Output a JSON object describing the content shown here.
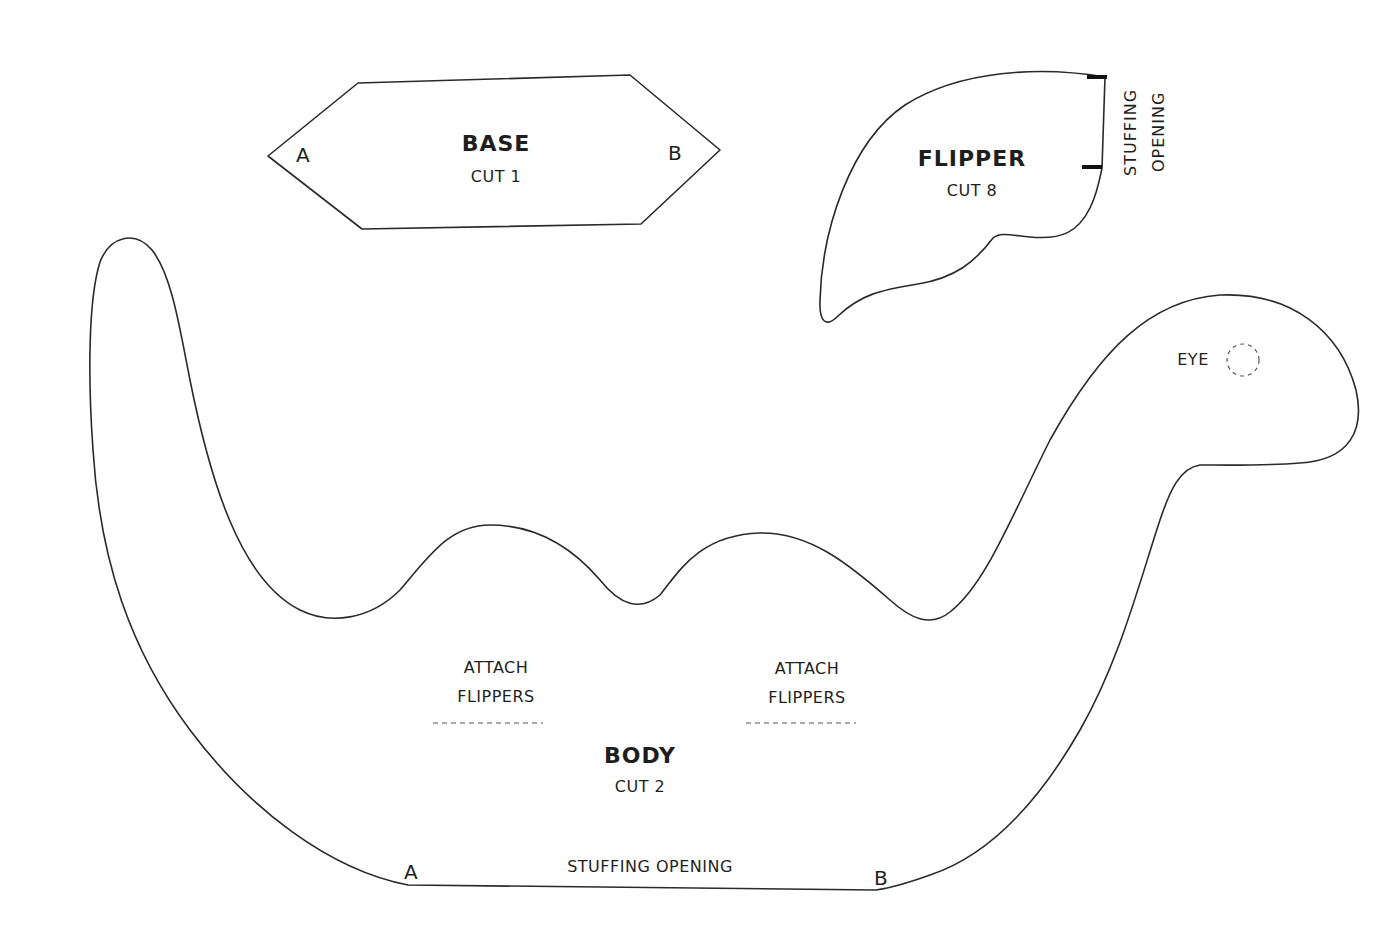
{
  "pattern": {
    "pieces": {
      "base": {
        "title": "BASE",
        "cut": "CUT 1",
        "point_a": "A",
        "point_b": "B"
      },
      "flipper": {
        "title": "FLIPPER",
        "cut": "CUT 8",
        "opening_line1": "STUFFING",
        "opening_line2": "OPENING"
      },
      "body": {
        "title": "BODY",
        "cut": "CUT 2",
        "eye_label": "EYE",
        "attach_left_line1": "ATTACH",
        "attach_left_line2": "FLIPPERS",
        "attach_right_line1": "ATTACH",
        "attach_right_line2": "FLIPPERS",
        "opening": "STUFFING OPENING",
        "point_a": "A",
        "point_b": "B"
      }
    },
    "colors": {
      "outline": "#2a2a2a",
      "background": "#ffffff",
      "text": "#1e1e1e"
    }
  }
}
